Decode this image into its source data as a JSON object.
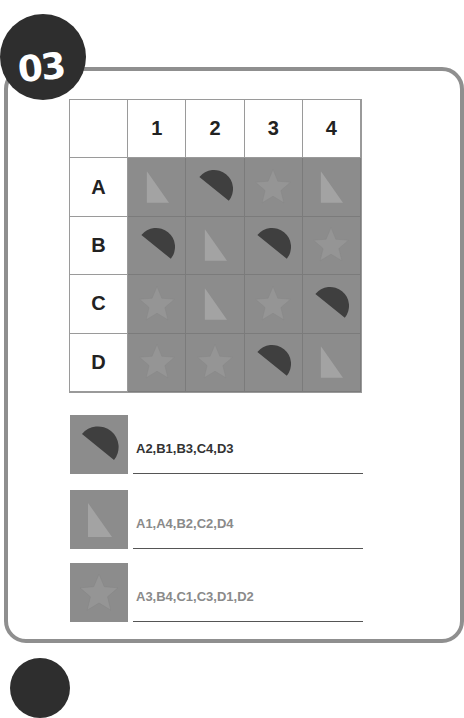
{
  "badge": {
    "number": "03"
  },
  "grid": {
    "column_headers": [
      "1",
      "2",
      "3",
      "4"
    ],
    "row_headers": [
      "A",
      "B",
      "C",
      "D"
    ],
    "cells": [
      [
        "triangle",
        "half-circle",
        "star",
        "triangle"
      ],
      [
        "half-circle",
        "triangle",
        "half-circle",
        "star"
      ],
      [
        "star",
        "triangle",
        "star",
        "half-circle"
      ],
      [
        "star",
        "star",
        "half-circle",
        "triangle"
      ]
    ]
  },
  "legend": [
    {
      "shape": "half-circle",
      "answer": "A2,B1,B3,C4,D3",
      "text_color": "#333333"
    },
    {
      "shape": "triangle",
      "answer": "A1,A4,B2,C2,D4",
      "text_color": "#8a8a8a"
    },
    {
      "shape": "star",
      "answer": "A3,B4,C1,C3,D1,D2",
      "text_color": "#8a8a8a"
    }
  ],
  "colors": {
    "frame": "#8f8f8f",
    "badge": "#2e2e2e",
    "cell_bg": "#8c8c8c",
    "half_circle": "#3f3f3f",
    "triangle": "#a3a3a3",
    "star": "#959595"
  }
}
